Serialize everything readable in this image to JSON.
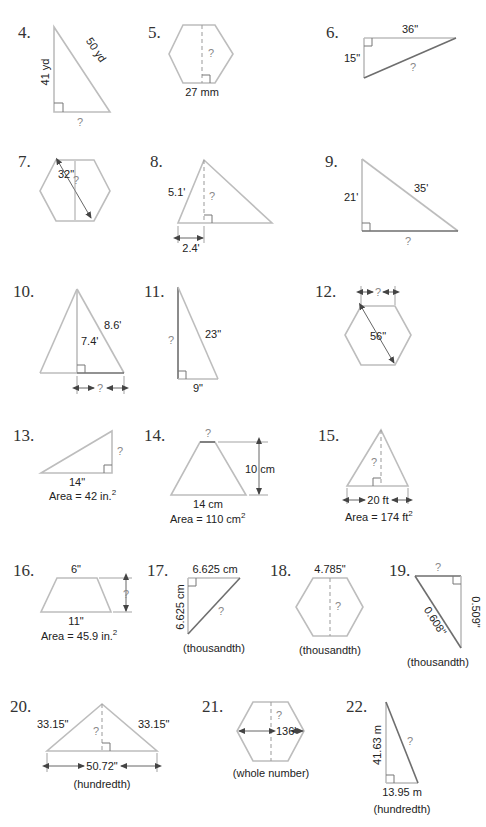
{
  "worksheet": {
    "problems": [
      {
        "number": "4.",
        "labels": [
          "41 yd",
          "50 yd",
          "?"
        ]
      },
      {
        "number": "5.",
        "labels": [
          "?",
          "27 mm"
        ]
      },
      {
        "number": "6.",
        "labels": [
          "36\"",
          "15\"",
          "?"
        ]
      },
      {
        "number": "7.",
        "labels": [
          "32\"",
          "?"
        ]
      },
      {
        "number": "8.",
        "labels": [
          "5.1'",
          "?",
          "2.4'"
        ]
      },
      {
        "number": "9.",
        "labels": [
          "21'",
          "35'",
          "?"
        ]
      },
      {
        "number": "10.",
        "labels": [
          "8.6'",
          "7.4'",
          "?"
        ]
      },
      {
        "number": "11.",
        "labels": [
          "?",
          "23\"",
          "9\""
        ]
      },
      {
        "number": "12.",
        "labels": [
          "?",
          "56\""
        ]
      },
      {
        "number": "13.",
        "labels": [
          "?",
          "14\""
        ],
        "area": {
          "prefix": "Area = 42 in.",
          "sup": "2"
        }
      },
      {
        "number": "14.",
        "labels": [
          "?",
          "10 cm",
          "14 cm"
        ],
        "area": {
          "prefix": "Area = 110 cm",
          "sup": "2"
        }
      },
      {
        "number": "15.",
        "labels": [
          "?",
          "20 ft"
        ],
        "area": {
          "prefix": "Area = 174 ft",
          "sup": "2"
        }
      },
      {
        "number": "16.",
        "labels": [
          "6\"",
          "?",
          "11\""
        ],
        "area": {
          "prefix": "Area = 45.9 in.",
          "sup": "2"
        }
      },
      {
        "number": "17.",
        "labels": [
          "6.625 cm",
          "6.625 cm",
          "?"
        ],
        "rounding": "(thousandth)"
      },
      {
        "number": "18.",
        "labels": [
          "4.785\"",
          "?"
        ],
        "rounding": "(thousandth)"
      },
      {
        "number": "19.",
        "labels": [
          "?",
          "0.608\"",
          "0.509\""
        ],
        "rounding": "(thousandth)"
      },
      {
        "number": "20.",
        "labels": [
          "33.15\"",
          "33.15\"",
          "?",
          "50.72\""
        ],
        "rounding": "(hundredth)"
      },
      {
        "number": "21.",
        "labels": [
          "?",
          "136'"
        ],
        "rounding": "(whole number)"
      },
      {
        "number": "22.",
        "labels": [
          "41.63 m",
          "?",
          "13.95 m"
        ],
        "rounding": "(hundredth)"
      }
    ]
  }
}
